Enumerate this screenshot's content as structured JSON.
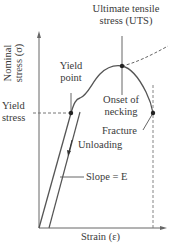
{
  "diagram": {
    "y_axis_label_line1": "Nominal",
    "y_axis_label_line2": "stress (σ)",
    "x_axis_label": "Strain (ε)",
    "labels": {
      "uts_line1": "Ultimate tensile",
      "uts_line2": "stress (UTS)",
      "yield_point_line1": "Yield",
      "yield_point_line2": "point",
      "yield_stress_line1": "Yield",
      "yield_stress_line2": "stress",
      "necking_line1": "Onset of",
      "necking_line2": "necking",
      "fracture": "Fracture",
      "unloading": "Unloading",
      "slope": "Slope = E"
    },
    "colors": {
      "curve": "#555555",
      "axes": "#555555",
      "point": "#222222"
    }
  }
}
